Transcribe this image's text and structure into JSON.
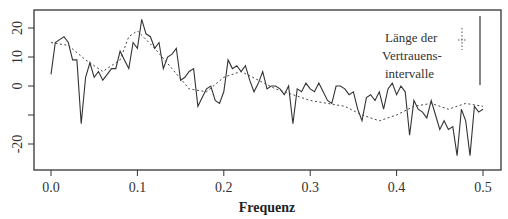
{
  "chart_data": {
    "type": "line",
    "title": "",
    "xlabel": "Frequenz",
    "ylabel": "",
    "xlim": [
      -0.02,
      0.52
    ],
    "ylim": [
      -29,
      26
    ],
    "x_ticks": [
      "0.0",
      "0.1",
      "0.2",
      "0.3",
      "0.4",
      "0.5"
    ],
    "y_ticks": [
      "20",
      "10",
      "0",
      "",
      "-20"
    ],
    "y_tick_values": [
      20,
      10,
      0,
      -10,
      -20
    ],
    "grid": false,
    "legend": {
      "lines": [
        "Länge der",
        "Vertrauens-",
        "intervalle"
      ],
      "position": "top-right"
    },
    "series": [
      {
        "name": "Periodogramm (log)",
        "style": "solid",
        "x": [
          0.0,
          0.005,
          0.01,
          0.015,
          0.02,
          0.025,
          0.03,
          0.035,
          0.04,
          0.045,
          0.05,
          0.055,
          0.06,
          0.065,
          0.07,
          0.075,
          0.08,
          0.085,
          0.09,
          0.095,
          0.1,
          0.105,
          0.11,
          0.115,
          0.12,
          0.125,
          0.13,
          0.135,
          0.14,
          0.145,
          0.15,
          0.155,
          0.16,
          0.165,
          0.17,
          0.175,
          0.18,
          0.185,
          0.19,
          0.195,
          0.2,
          0.205,
          0.21,
          0.215,
          0.22,
          0.225,
          0.23,
          0.235,
          0.24,
          0.245,
          0.25,
          0.255,
          0.26,
          0.265,
          0.27,
          0.275,
          0.28,
          0.285,
          0.29,
          0.295,
          0.3,
          0.305,
          0.31,
          0.315,
          0.32,
          0.325,
          0.33,
          0.335,
          0.34,
          0.345,
          0.35,
          0.355,
          0.36,
          0.365,
          0.37,
          0.375,
          0.38,
          0.385,
          0.39,
          0.395,
          0.4,
          0.405,
          0.41,
          0.415,
          0.42,
          0.425,
          0.43,
          0.435,
          0.44,
          0.445,
          0.45,
          0.455,
          0.46,
          0.465,
          0.47,
          0.475,
          0.48,
          0.485,
          0.49,
          0.495,
          0.5
        ],
        "values": [
          4,
          15,
          16,
          17,
          15,
          9,
          9,
          -13,
          3,
          8,
          3,
          5,
          2,
          4,
          6,
          6,
          12,
          9,
          6,
          15,
          13,
          23,
          18,
          17,
          13,
          15,
          6,
          10,
          11,
          13,
          2,
          3,
          5,
          6,
          -7,
          -4,
          -1,
          0,
          -5,
          -6,
          -2,
          9,
          6,
          7,
          5,
          7,
          2,
          -2,
          1,
          5,
          -1,
          0,
          0,
          -1,
          -3,
          0,
          -13,
          -1,
          -2,
          1,
          -1,
          -2,
          1,
          -2,
          -5,
          -6,
          0,
          0,
          -1,
          -3,
          -2,
          -8,
          -12,
          -4,
          -3,
          -5,
          -2,
          -8,
          -1,
          1,
          -3,
          0,
          -2,
          -17,
          -5,
          -8,
          -9,
          -11,
          -5,
          -10,
          -15,
          -12,
          -15,
          -14,
          -24,
          -8,
          -12,
          -24,
          -7,
          -9,
          -8
        ]
      },
      {
        "name": "Geglättet",
        "style": "dotted",
        "x": [
          0.0,
          0.02,
          0.04,
          0.06,
          0.08,
          0.09,
          0.1,
          0.12,
          0.14,
          0.16,
          0.18,
          0.2,
          0.22,
          0.24,
          0.26,
          0.28,
          0.3,
          0.32,
          0.34,
          0.36,
          0.38,
          0.4,
          0.42,
          0.44,
          0.46,
          0.48,
          0.5
        ],
        "values": [
          15,
          14,
          9,
          5,
          9,
          17,
          19,
          13,
          6,
          -1,
          -2,
          3,
          5,
          2,
          -1,
          -3,
          -5,
          -6,
          -7,
          -10,
          -12,
          -10,
          -7,
          -6,
          -8,
          -6,
          -7
        ]
      }
    ],
    "confidence_markers": [
      {
        "style": "dotted",
        "y_top_px": 18,
        "y_bottom_px": 50
      },
      {
        "style": "solid",
        "y_top_px": 16,
        "y_bottom_px": 85
      }
    ]
  }
}
